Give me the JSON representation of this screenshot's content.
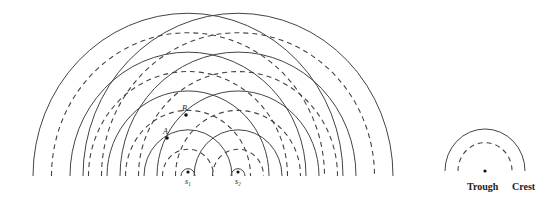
{
  "diagram": {
    "sources": [
      {
        "label": "S1",
        "display": "s₁",
        "x": 188,
        "y": 176
      },
      {
        "label": "S2",
        "display": "s₂",
        "x": 238,
        "y": 176
      }
    ],
    "crest_radii": [
      7,
      44,
      81,
      118,
      155
    ],
    "trough_radii": [
      25.5,
      62.5,
      99.5,
      136.5
    ],
    "points": [
      {
        "label": "A",
        "x": 167,
        "y": 138
      },
      {
        "label": "B",
        "x": 186,
        "y": 115
      }
    ],
    "legend": {
      "center": {
        "x": 485,
        "y": 171
      },
      "crest_radius": 40,
      "trough_radius": 27,
      "trough_label": "Trough",
      "crest_label": "Crest"
    },
    "colors": {
      "line": "#444444",
      "background": "#ffffff"
    }
  }
}
